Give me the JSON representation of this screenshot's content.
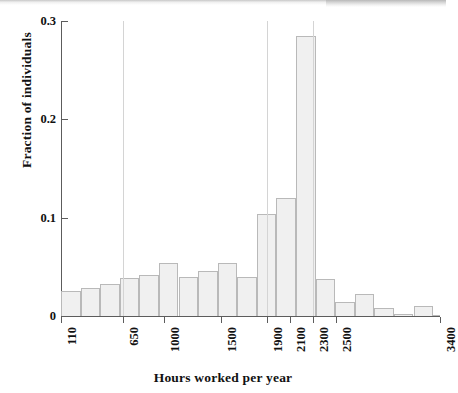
{
  "figure": {
    "background_color": "#ffffff",
    "axis_color": "#5c5c5c",
    "bar_fill_color": "#f0f0f0",
    "bar_edge_color": "#b9b9b9"
  },
  "chart_data": {
    "type": "bar",
    "title": "",
    "subtitle": "",
    "xlabel": "Hours worked per year",
    "ylabel": "Fraction of individuals",
    "grid": false,
    "legend": null,
    "xlim": [
      110,
      3400
    ],
    "ylim": [
      0,
      0.3
    ],
    "y_ticks": [
      0,
      0.1,
      0.2,
      0.3
    ],
    "y_tick_labels": [
      "0",
      "0.1",
      "0.2",
      "0.3"
    ],
    "x_ticks": [
      110,
      650,
      1000,
      1500,
      1900,
      2100,
      2300,
      2500,
      3400
    ],
    "x_tick_labels": [
      "110",
      "650",
      "1000",
      "1500",
      "1900",
      "2100",
      "2300",
      "2500",
      "3400"
    ],
    "bin_edges": [
      110,
      280,
      450,
      620,
      790,
      960,
      1130,
      1300,
      1470,
      1640,
      1810,
      1980,
      2150,
      2320,
      2490,
      2660,
      2830,
      3000,
      3170,
      3340,
      3400
    ],
    "categories": [
      "110-280",
      "280-450",
      "450-620",
      "620-790",
      "790-960",
      "960-1130",
      "1130-1300",
      "1300-1470",
      "1470-1640",
      "1640-1810",
      "1810-1980",
      "1980-2150",
      "2150-2320",
      "2320-2490",
      "2490-2660",
      "2660-2830",
      "2830-3000",
      "3000-3170",
      "3170-3340",
      "3340-3400"
    ],
    "values": [
      0.025,
      0.028,
      0.033,
      0.039,
      0.042,
      0.054,
      0.04,
      0.046,
      0.054,
      0.04,
      0.104,
      0.12,
      0.285,
      0.038,
      0.014,
      0.022,
      0.008,
      0.002,
      0.01,
      0.001
    ],
    "vertical_rules_at_x": [
      650,
      1900,
      2300
    ]
  }
}
